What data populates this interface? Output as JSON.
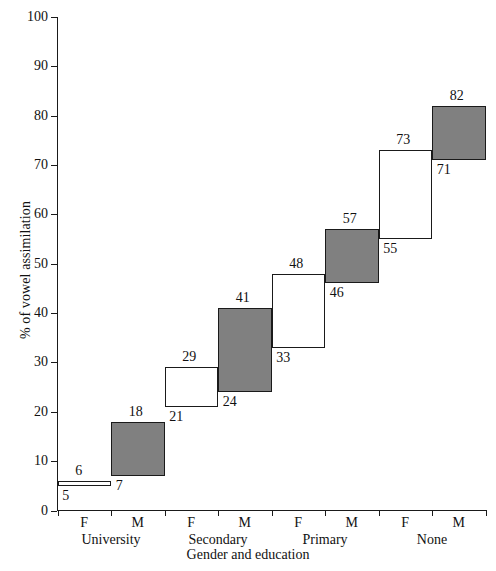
{
  "chart_data": {
    "type": "bar",
    "subtype": "floating-range-bar",
    "title": "",
    "xlabel": "Gender and education",
    "ylabel": "% of vowel assimilation",
    "ylim": [
      0,
      100
    ],
    "ytick_values": [
      0,
      10,
      20,
      30,
      40,
      50,
      60,
      70,
      80,
      90,
      100
    ],
    "ytick_labels": [
      "0",
      "10",
      "20",
      "30",
      "40",
      "50",
      "60",
      "70",
      "80",
      "90",
      "100"
    ],
    "grid": false,
    "legend": null,
    "groups": [
      "University",
      "Secondary",
      "Primary",
      "None"
    ],
    "categories": [
      "F",
      "M",
      "F",
      "M",
      "F",
      "M",
      "F",
      "M"
    ],
    "bars": [
      {
        "group": "University",
        "gender": "F",
        "low": 5,
        "high": 6,
        "low_label": "5",
        "high_label": "6",
        "fill": "hollow"
      },
      {
        "group": "University",
        "gender": "M",
        "low": 7,
        "high": 18,
        "low_label": "7",
        "high_label": "18",
        "fill": "filled"
      },
      {
        "group": "Secondary",
        "gender": "F",
        "low": 21,
        "high": 29,
        "low_label": "21",
        "high_label": "29",
        "fill": "hollow"
      },
      {
        "group": "Secondary",
        "gender": "M",
        "low": 24,
        "high": 41,
        "low_label": "24",
        "high_label": "41",
        "fill": "filled"
      },
      {
        "group": "Primary",
        "gender": "F",
        "low": 33,
        "high": 48,
        "low_label": "33",
        "high_label": "48",
        "fill": "hollow"
      },
      {
        "group": "Primary",
        "gender": "M",
        "low": 46,
        "high": 57,
        "low_label": "46",
        "high_label": "57",
        "fill": "filled"
      },
      {
        "group": "None",
        "gender": "F",
        "low": 55,
        "high": 73,
        "low_label": "55",
        "high_label": "73",
        "fill": "hollow"
      },
      {
        "group": "None",
        "gender": "M",
        "low": 71,
        "high": 82,
        "low_label": "71",
        "high_label": "82",
        "fill": "filled"
      }
    ],
    "colors": {
      "filled": "#808080",
      "hollow": "#ffffff",
      "outline": "#1a1a1a",
      "text": "#111111",
      "background": "#ffffff"
    }
  }
}
